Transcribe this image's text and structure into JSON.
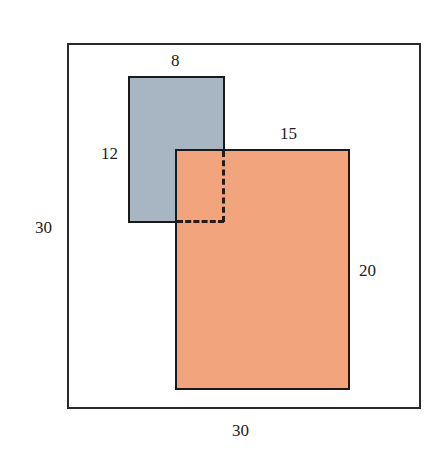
{
  "figure": {
    "outer_square": {
      "width_label": "30",
      "height_label": "30"
    },
    "blue_rectangle": {
      "width_label": "8",
      "height_label": "12",
      "color": "#a8b6c4"
    },
    "orange_rectangle": {
      "width_label": "15",
      "height_label": "20",
      "color": "#f2a47c"
    },
    "overlap": {
      "style": "dashed"
    }
  }
}
